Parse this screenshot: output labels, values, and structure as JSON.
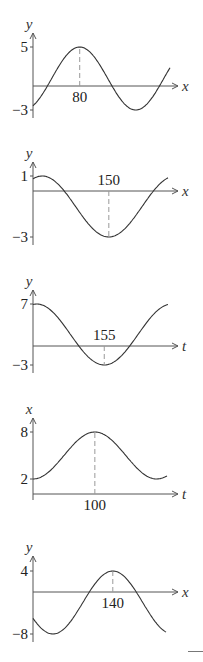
{
  "chart_data": [
    {
      "type": "line",
      "function": "sinusoid",
      "xlabel": "x",
      "ylabel": "y",
      "max": 5,
      "min": -3,
      "max_at": 80,
      "marked_x": 80,
      "marked_kind": "max",
      "start_phase_deg": -60,
      "end_phase_deg": 380,
      "y_ticks": [
        "5",
        "-3"
      ],
      "x_tick_label": "80",
      "label_below_axis": true
    },
    {
      "type": "line",
      "function": "sinusoid",
      "xlabel": "x",
      "ylabel": "y",
      "max": 1,
      "min": -3,
      "min_at": 150,
      "marked_x": 150,
      "marked_kind": "min",
      "start_phase_deg": 65,
      "end_phase_deg": 430,
      "y_ticks": [
        "1",
        "-3"
      ],
      "x_tick_label": "150",
      "label_below_axis": false
    },
    {
      "type": "line",
      "function": "sinusoid",
      "xlabel": "t",
      "ylabel": "y",
      "max": 7,
      "min": -3,
      "min_at": 155,
      "marked_x": 155,
      "marked_kind": "min",
      "start_phase_deg": 80,
      "end_phase_deg": 440,
      "y_ticks": [
        "7",
        "-3"
      ],
      "x_tick_label": "155",
      "label_below_axis": false
    },
    {
      "type": "line",
      "function": "sinusoid",
      "xlabel": "t",
      "ylabel": "x",
      "max": 8,
      "min": 2,
      "max_at": 100,
      "marked_x": 100,
      "marked_kind": "max",
      "start_phase_deg": -90,
      "end_phase_deg": 300,
      "y_ticks": [
        "8",
        "2"
      ],
      "x_tick_label": "100",
      "label_below_axis": true
    },
    {
      "type": "line",
      "function": "sinusoid",
      "xlabel": "x",
      "ylabel": "y",
      "max": 4,
      "min": -8,
      "max_at": 140,
      "marked_x": 140,
      "marked_kind": "max",
      "start_phase_deg": -150,
      "end_phase_deg": 250,
      "y_ticks": [
        "4",
        "-8"
      ],
      "x_tick_label": "140",
      "label_below_axis": true
    }
  ]
}
